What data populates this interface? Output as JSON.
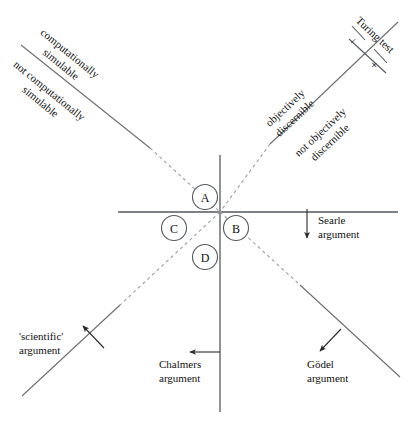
{
  "diagram": {
    "axis_color": "#4a4a4a",
    "dash_color": "#8a8a8a",
    "line_color": "#3a3a3a",
    "text_color": "#111111",
    "background": "#ffffff"
  },
  "axis_labels": {
    "upper_left_above": "computationally",
    "upper_left_above2": "simulable",
    "upper_left_below": "not computationally",
    "upper_left_below2": "simulable",
    "upper_right_above": "objectively",
    "upper_right_above2": "discernible",
    "upper_right_below": "not objectively",
    "upper_right_below2": "discernible"
  },
  "turing": {
    "label": "Turing test",
    "minus": "−",
    "plus": "+"
  },
  "quadrants": [
    {
      "id": "A",
      "letter": "A"
    },
    {
      "id": "B",
      "letter": "B"
    },
    {
      "id": "C",
      "letter": "C"
    },
    {
      "id": "D",
      "letter": "D"
    }
  ],
  "arguments": [
    {
      "id": "searle",
      "line1": "Searle",
      "line2": "argument"
    },
    {
      "id": "scientific",
      "line1": "'scientific'",
      "line2": "argument"
    },
    {
      "id": "chalmers",
      "line1": "Chalmers",
      "line2": "argument"
    },
    {
      "id": "godel",
      "line1": "Gödel",
      "line2": "argument"
    }
  ]
}
